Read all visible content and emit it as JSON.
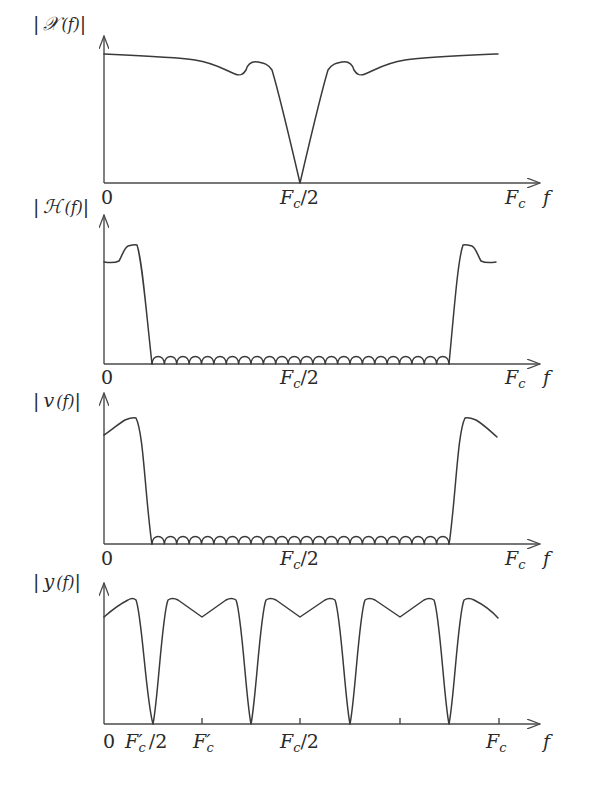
{
  "chart_data": [
    {
      "type": "line",
      "title": "",
      "ylabel": "|X(f)|",
      "xlabel": "f",
      "x_ticks": [
        "0",
        "Fc/2",
        "Fc"
      ],
      "description": "Input spectrum magnitude: high near 0 and Fc, slight dip with bump before/after Fc/2, V-shaped notch to zero at Fc/2",
      "x": [
        0,
        0.15,
        0.3,
        0.45,
        0.55,
        0.6,
        0.65,
        0.7,
        0.8,
        1.0,
        1.2,
        1.3,
        1.35,
        1.4,
        1.45,
        1.55,
        1.7,
        1.85,
        2.0
      ],
      "values": [
        0.93,
        0.92,
        0.89,
        0.82,
        0.79,
        0.86,
        0.85,
        0.8,
        0.45,
        0.0,
        0.45,
        0.8,
        0.85,
        0.86,
        0.79,
        0.82,
        0.89,
        0.92,
        0.93
      ],
      "x_units": "Fc/2"
    },
    {
      "type": "line",
      "ylabel": "|H(f)|",
      "xlabel": "f",
      "x_ticks": [
        "0",
        "Fc/2",
        "Fc"
      ],
      "description": "Low-pass (periodic) filter response: passband near 0 and Fc with small ripple/peak, stopband with small arc ripples from ~0.1Fc to ~0.9Fc",
      "passband_edges": [
        0.1,
        0.9
      ],
      "stopband_ripple_count": 24,
      "x_units": "fraction of Fc"
    },
    {
      "type": "line",
      "ylabel": "|v(f)|",
      "xlabel": "f",
      "x_ticks": [
        "0",
        "Fc/2",
        "Fc"
      ],
      "description": "Filtered spectrum: rising passband near 0, mirror near Fc, stopband ripple arcs in between",
      "passband_edges": [
        0.1,
        0.9
      ],
      "stopband_ripple_count": 24,
      "x_units": "fraction of Fc"
    },
    {
      "type": "line",
      "ylabel": "|y(f)|",
      "xlabel": "f",
      "x_ticks": [
        "0",
        "F'c/2",
        "F'c",
        "Fc/2",
        "Fc"
      ],
      "description": "Decimated spectrum: periodic replicas with period F'c = Fc/4; zeros at F'c/2, 3F'c/2, 5F'c/2, 7F'c/2; small V-dips at F'c, Fc/2, 3F'c",
      "zeros_at": [
        "F'c/2",
        "3F'c/2",
        "5F'c/2",
        "7F'c/2"
      ],
      "x_units": "fraction of Fc"
    }
  ],
  "panels": [
    {
      "ylabel_bars": "|",
      "ylabel_fn": "𝒳",
      "ylabel_arg": "(f)",
      "tick0": "0",
      "tick_mid": "F",
      "tick_mid_sub": "c",
      "tick_mid_tail": "/2",
      "tick_end": "F",
      "tick_end_sub": "c",
      "axis_var": "f"
    },
    {
      "ylabel_fn": "ℋ",
      "ylabel_arg": "(f)",
      "tick0": "0",
      "tick_mid": "F",
      "tick_mid_sub": "c",
      "tick_mid_tail": "/2",
      "tick_end": "F",
      "tick_end_sub": "c",
      "axis_var": "f"
    },
    {
      "ylabel_fn": "v",
      "ylabel_arg": "(f)",
      "tick0": "0",
      "tick_mid": "F",
      "tick_mid_sub": "c",
      "tick_mid_tail": "/2",
      "tick_end": "F",
      "tick_end_sub": "c",
      "axis_var": "f"
    },
    {
      "ylabel_fn": "y",
      "ylabel_arg": "(f)",
      "tick0": "0",
      "tick_q": "F′",
      "tick_q_sub": "c",
      "tick_q_tail": "/2",
      "tick_h": "F′",
      "tick_h_sub": "c",
      "tick_mid": "F",
      "tick_mid_sub": "c",
      "tick_mid_tail": "/2",
      "tick_end": "F",
      "tick_end_sub": "c",
      "axis_var": "f"
    }
  ],
  "bar": "|"
}
